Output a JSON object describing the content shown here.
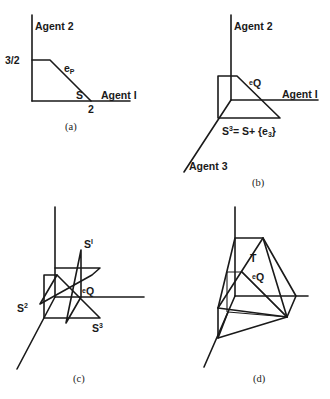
{
  "panels": {
    "a": {
      "caption": "(a)",
      "y_axis_label": "Agent 2",
      "x_axis_label": "Agent I",
      "y_tick": "3/2",
      "x_tick": "2",
      "point_label": "e",
      "point_sub": "P",
      "set_label": "S"
    },
    "b": {
      "caption": "(b)",
      "y_axis_label": "Agent 2",
      "x_axis_label": "Agent I",
      "z_axis_label": "Agent 3",
      "point_label": "e",
      "point_sub": "Q",
      "set_label_main": "S",
      "set_label_sup": "3",
      "set_label_rest": "= S+ {e",
      "set_label_sub": "3",
      "set_label_end": "}"
    },
    "c": {
      "caption": "(c)",
      "s1_main": "S",
      "s1_sup": "I",
      "s2_main": "S",
      "s2_sup": "2",
      "s3_main": "S",
      "s3_sup": "3",
      "point_label": "e",
      "point_sub": "Q"
    },
    "d": {
      "caption": "(d)",
      "set_label": "T",
      "point_label": "e",
      "point_sub": "Q"
    }
  }
}
